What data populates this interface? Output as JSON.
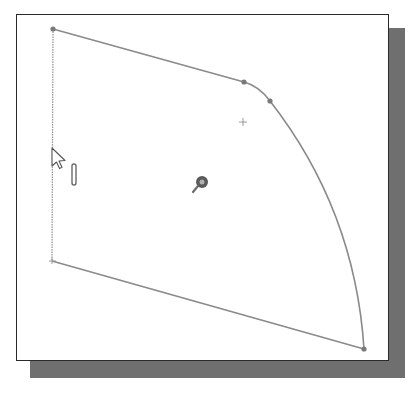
{
  "canvas": {
    "width": 418,
    "height": 399,
    "background": "#ffffff",
    "frame_border": "#2a2a2a",
    "shadow_color": "#6f6f6f",
    "sketch_color": "#8a8a8a",
    "point_color": "#7a7a7a"
  },
  "sketch": {
    "vertices": [
      {
        "name": "top-left",
        "x": 53,
        "y": 29
      },
      {
        "name": "arc-start",
        "x": 244,
        "y": 82
      },
      {
        "name": "arc-mid",
        "x": 270,
        "y": 101
      },
      {
        "name": "bottom-right",
        "x": 364,
        "y": 349
      },
      {
        "name": "bottom-left",
        "x": 52,
        "y": 261
      }
    ],
    "arc_center_marker": {
      "x": 243,
      "y": 122
    },
    "origin_icon": {
      "x": 200,
      "y": 183
    },
    "cursor": {
      "x": 52,
      "y": 150
    },
    "constraint_glyph": {
      "type": "vertical",
      "x": 74,
      "y": 165
    }
  }
}
